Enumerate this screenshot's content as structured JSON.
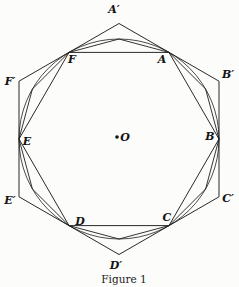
{
  "figure": {
    "caption": "Figure 1",
    "center": {
      "label": "O"
    },
    "inscribed_hexagon": {
      "description": "hexagon inscribed in circle",
      "labels": [
        "A",
        "B",
        "C",
        "D",
        "E",
        "F"
      ]
    },
    "inscribed_dodecagon": {
      "description": "12-gon inscribed in circle sharing hexagon vertices"
    },
    "circumscribed_hexagon": {
      "description": "hexagon circumscribed about circle, tangent at A-F",
      "labels": [
        "A′",
        "B′",
        "C′",
        "D′",
        "E′",
        "F′"
      ]
    },
    "colors": {
      "stroke": "#1e1e1e",
      "background": "#fcfcfb",
      "text": "#141414"
    }
  }
}
